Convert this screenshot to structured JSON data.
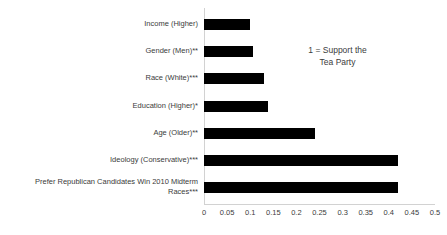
{
  "chart_data": {
    "type": "bar",
    "orientation": "horizontal",
    "title": "",
    "xlabel": "",
    "ylabel": "",
    "xlim": [
      0,
      0.5
    ],
    "grid": false,
    "legend": null,
    "annotations": [
      {
        "text": "1 = Support the\nTea Party"
      }
    ],
    "xticks": [
      "0",
      "0.05",
      "0.1",
      "0.15",
      "0.2",
      "0.25",
      "0.3",
      "0.35",
      "0.4",
      "0.45",
      "0.5"
    ],
    "xtick_values": [
      0,
      0.05,
      0.1,
      0.15,
      0.2,
      0.25,
      0.3,
      0.35,
      0.4,
      0.45,
      0.5
    ],
    "categories": [
      "Income (Higher)",
      "Gender (Men)**",
      "Race (White)***",
      "Education (Higher)*",
      "Age (Older)**",
      "Ideology (Conservative)***",
      "Prefer Republican Candidates Win 2010 Midterm\nRaces***"
    ],
    "values": [
      0.1,
      0.105,
      0.13,
      0.138,
      0.24,
      0.42,
      0.42
    ],
    "bar_color": "#000000",
    "axis_color": "#d2d2d2",
    "text_color": "#3b3b3b"
  }
}
